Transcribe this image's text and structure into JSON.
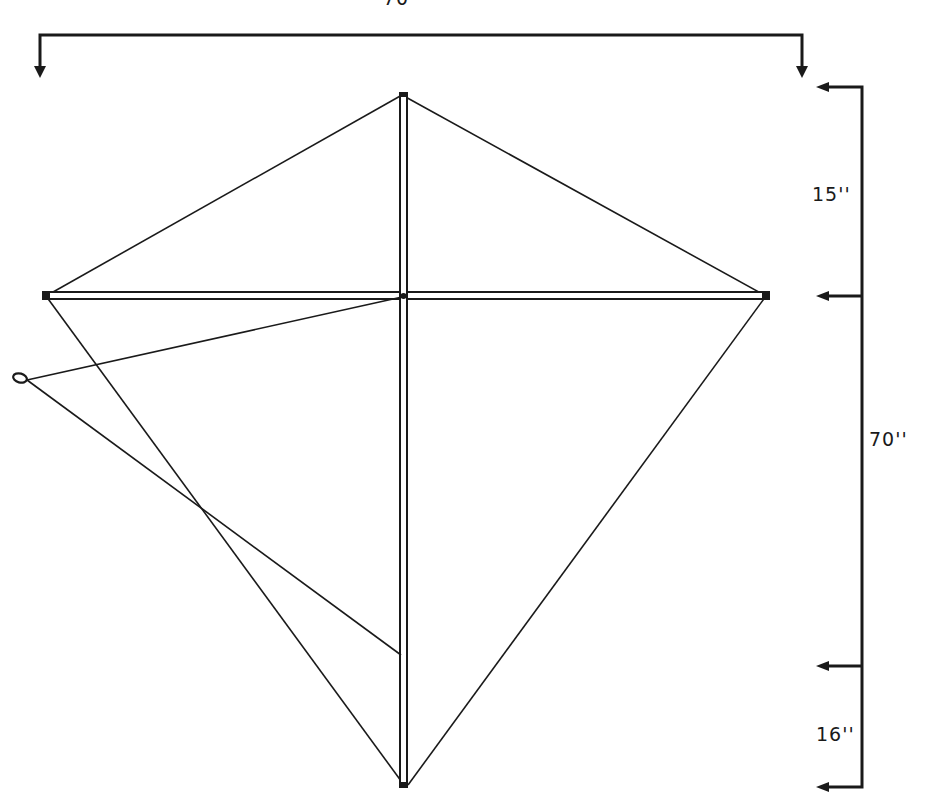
{
  "diagram": {
    "colors": {
      "ink": "#1a1a1a",
      "background": "#ffffff"
    },
    "dimensions": {
      "width_label": "70''",
      "upper_section_label": "15''",
      "overall_height_label": "70''",
      "bridle_lower_section_label": "16''"
    },
    "parts": [
      "spine",
      "spar",
      "outline-string",
      "bridle",
      "bridle-loop"
    ]
  }
}
